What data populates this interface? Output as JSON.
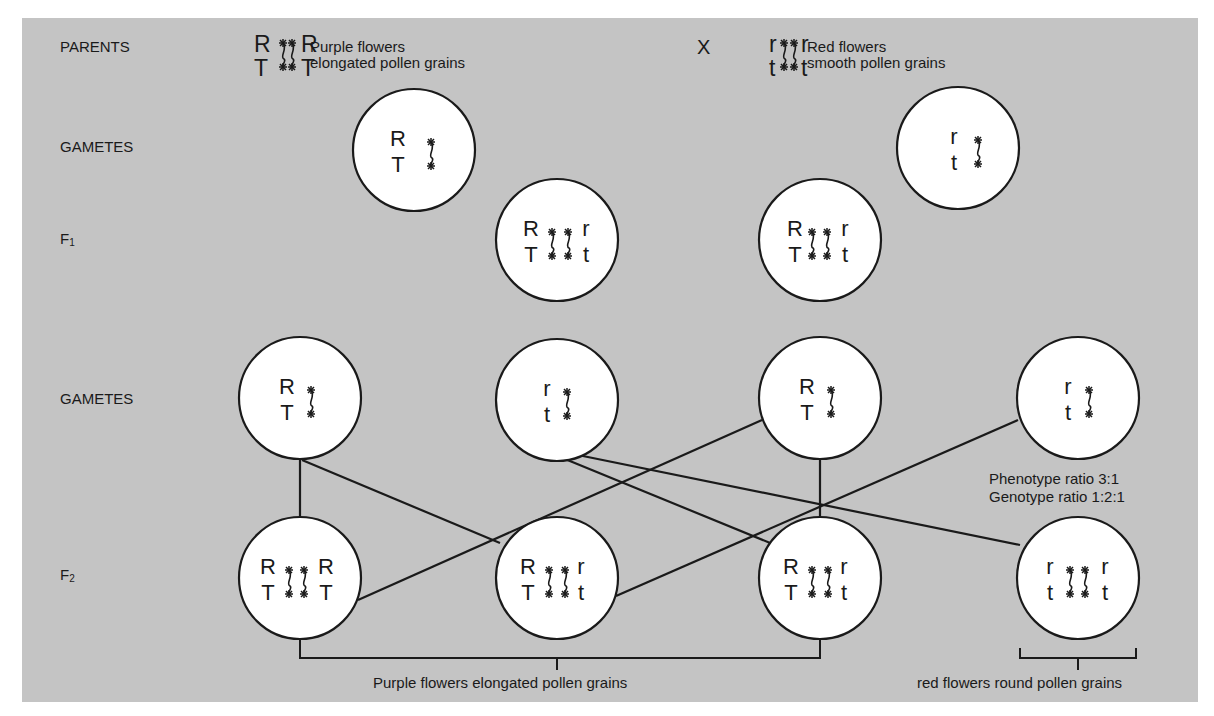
{
  "rows": {
    "parents": "PARENTS",
    "gametes_1": "GAMETES",
    "f1": {
      "base": "F",
      "sub": "1"
    },
    "gametes_2": "GAMETES",
    "f2": {
      "base": "F",
      "sub": "2"
    }
  },
  "parents": {
    "cross_symbol": "X",
    "left": {
      "genotype": {
        "top": [
          "R",
          "R"
        ],
        "bottom": [
          "T",
          "T"
        ]
      },
      "phenotype_line1": "Purple flowers",
      "phenotype_line2": "elongated pollen grains"
    },
    "right": {
      "genotype": {
        "top": [
          "r",
          "r"
        ],
        "bottom": [
          "t",
          "t"
        ]
      },
      "phenotype_line1": "Red flowers",
      "phenotype_line2": "smooth pollen grains"
    }
  },
  "gametes_parent": [
    {
      "top": "R",
      "bottom": "T"
    },
    {
      "top": "r",
      "bottom": "t"
    }
  ],
  "f1": [
    {
      "top": [
        "R",
        "r"
      ],
      "bottom": [
        "T",
        "t"
      ]
    },
    {
      "top": [
        "R",
        "r"
      ],
      "bottom": [
        "T",
        "t"
      ]
    }
  ],
  "gametes_f1": [
    {
      "top": "R",
      "bottom": "T"
    },
    {
      "top": "r",
      "bottom": "t"
    },
    {
      "top": "R",
      "bottom": "T"
    },
    {
      "top": "r",
      "bottom": "t"
    }
  ],
  "f2": [
    {
      "top": [
        "R",
        "R"
      ],
      "bottom": [
        "T",
        "T"
      ]
    },
    {
      "top": [
        "R",
        "r"
      ],
      "bottom": [
        "T",
        "t"
      ]
    },
    {
      "top": [
        "R",
        "r"
      ],
      "bottom": [
        "T",
        "t"
      ]
    },
    {
      "top": [
        "r",
        "r"
      ],
      "bottom": [
        "t",
        "t"
      ]
    }
  ],
  "ratios": {
    "phenotype": "Phenotype ratio 3:1",
    "genotype": "Genotype ratio 1:2:1"
  },
  "outcomes": {
    "purple": "Purple flowers elongated pollen grains",
    "red": "red flowers round pollen grains"
  },
  "colors": {
    "panel": "#c4c4c4",
    "circle_fill": "#ffffff",
    "stroke": "#1a1a1a"
  }
}
